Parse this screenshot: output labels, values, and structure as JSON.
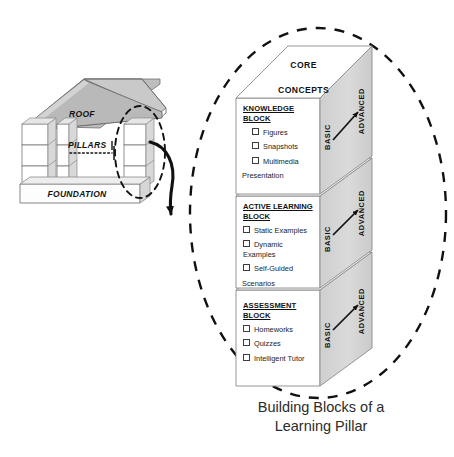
{
  "diagram": {
    "house": {
      "roof_label": "ROOF",
      "pillars_label": "PILLARS",
      "foundation_label": "FOUNDATION"
    },
    "connector": {
      "name": "curved-arrow",
      "from": "highlighted-pillar",
      "to": "building-blocks-group"
    },
    "stack": {
      "top_face_label_line1": "CORE",
      "top_face_label_line2": "CONCEPTS",
      "side_label_left": "BASIC",
      "side_label_right": "ADVANCED",
      "blocks": [
        {
          "title_line1": "KNOWLEDGE",
          "title_line2": "BLOCK",
          "items": [
            {
              "text": "Figures",
              "continuation": ""
            },
            {
              "text": "Snapshots",
              "continuation": ""
            },
            {
              "text": "Multimedia",
              "continuation": "Presentation"
            }
          ]
        },
        {
          "title_line1": "ACTIVE LEARNING",
          "title_line2": "BLOCK",
          "items": [
            {
              "text": "Static Examples",
              "continuation": ""
            },
            {
              "text": "Dynamic Examples",
              "continuation": ""
            },
            {
              "text": "Self-Guided",
              "continuation": "Scenarios"
            }
          ]
        },
        {
          "title_line1": "ASSESSMENT",
          "title_line2": "BLOCK",
          "items": [
            {
              "text": "Homeworks",
              "continuation": ""
            },
            {
              "text": "Quizzes",
              "continuation": ""
            },
            {
              "text": "Intelligent Tutor",
              "continuation": ""
            }
          ]
        }
      ]
    },
    "caption_line1": "Building Blocks of a",
    "caption_line2": "Learning Pillar",
    "colors": {
      "side_face_gray": "#d6d6d6",
      "roof_gray": "#bfbfbf",
      "outline": "#4d4d4d",
      "dashed_stroke": "#1a1a1a",
      "text": "#1a1a1a",
      "face_white": "#ffffff"
    }
  }
}
